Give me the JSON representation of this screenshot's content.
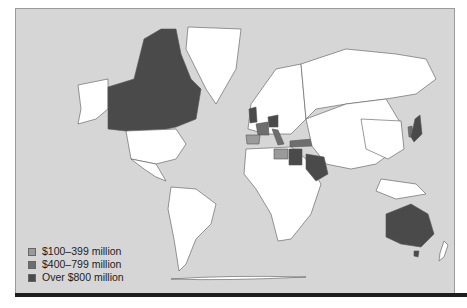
{
  "colors": {
    "ocean": "#d6d6d6",
    "land": "#ffffff",
    "low": "#9a9a9a",
    "mid": "#6e6e6e",
    "high": "#4a4a4a",
    "border": "#555555"
  },
  "legend": {
    "items": [
      {
        "label": "$100–399 million",
        "color": "#9a9a9a"
      },
      {
        "label": "$400–799 million",
        "color": "#6e6e6e"
      },
      {
        "label": "Over $800 million",
        "color": "#4a4a4a"
      }
    ]
  },
  "regions": {
    "high": [
      "Canada",
      "United Kingdom",
      "Germany",
      "Egypt",
      "Saudi Arabia",
      "Japan",
      "Australia"
    ],
    "mid": [
      "France",
      "Italy",
      "Turkey",
      "Israel",
      "South Korea"
    ],
    "low": [
      "Spain",
      "Mexico",
      "Greece",
      "Libya",
      "China",
      "Taiwan",
      "Indonesia",
      "Philippines"
    ]
  }
}
